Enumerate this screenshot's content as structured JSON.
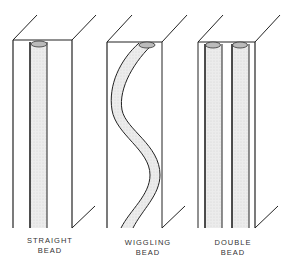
{
  "diagram": {
    "panels": [
      {
        "id": "straight",
        "label_line1": "STRAIGHT",
        "label_line2": "BEAD"
      },
      {
        "id": "wiggling",
        "label_line1": "WIGGLING",
        "label_line2": "BEAD"
      },
      {
        "id": "double",
        "label_line1": "DOUBLE",
        "label_line2": "BEAD"
      }
    ],
    "colors": {
      "line": "#222222",
      "bead_fill": "#e8e8e8",
      "background": "#ffffff"
    }
  }
}
